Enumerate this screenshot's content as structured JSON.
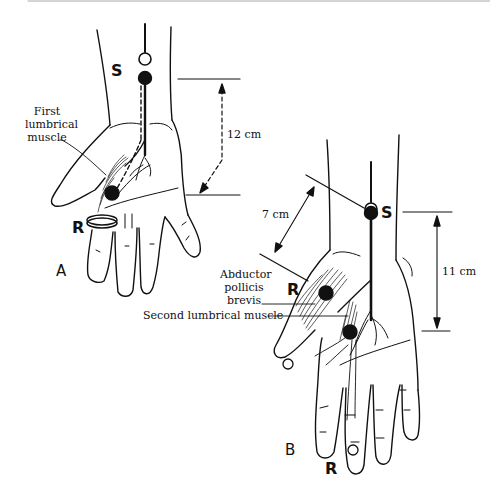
{
  "figure": {
    "panel_a": {
      "label": "A",
      "stimulation_label": "S",
      "recording_label": "R",
      "muscle_label_lines": [
        "First",
        "lumbrical",
        "muscle"
      ],
      "distance": "12 cm"
    },
    "panel_b": {
      "label": "B",
      "stimulation_label": "S",
      "recording_label_thenar": "R",
      "recording_label_finger": "R",
      "muscle_label_lines": [
        "Abductor",
        "pollicis",
        "brevis"
      ],
      "second_muscle_label": "Second lumbrical muscle",
      "distance_oblique": "7 cm",
      "distance_vertical": "11 cm"
    }
  }
}
